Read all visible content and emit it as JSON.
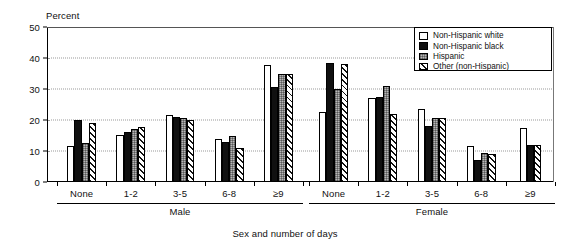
{
  "chart_data": {
    "type": "bar",
    "title": "",
    "xlabel": "Sex and number of days",
    "ylabel": "Percent",
    "ylim": [
      0,
      50
    ],
    "yticks": [
      0,
      10,
      20,
      30,
      40,
      50
    ],
    "grid": "horizontal dotted at 10, 20, 30, 40",
    "legend_position": "top-right inside plot",
    "panels": [
      "Male",
      "Female"
    ],
    "categories": [
      "None",
      "1-2",
      "3-5",
      "6-8",
      "≥9"
    ],
    "series": [
      {
        "name": "Non-Hispanic white",
        "pattern": "white",
        "male": [
          11.5,
          15.2,
          21.5,
          14.0,
          37.8
        ],
        "female": [
          22.5,
          27.0,
          23.5,
          11.5,
          17.5
        ]
      },
      {
        "name": "Non-Hispanic black",
        "pattern": "black",
        "male": [
          20.0,
          16.0,
          21.0,
          13.0,
          30.5
        ],
        "female": [
          38.5,
          27.5,
          18.0,
          7.0,
          12.0
        ]
      },
      {
        "name": "Hispanic",
        "pattern": "gray-stipple",
        "male": [
          12.5,
          17.0,
          20.5,
          15.0,
          35.0
        ],
        "female": [
          30.0,
          31.0,
          20.5,
          9.5,
          null
        ]
      },
      {
        "name": "Other (non-Hispanic)",
        "pattern": "diagonal-hatch",
        "male": [
          19.0,
          17.8,
          20.0,
          11.0,
          35.0
        ],
        "female": [
          38.0,
          22.0,
          20.5,
          9.0,
          12.0
        ]
      }
    ]
  },
  "axis": {
    "y_title": "Percent",
    "y_tick_labels": [
      "50",
      "40",
      "30",
      "20",
      "10",
      "0"
    ],
    "x_title": "Sex and number of days"
  },
  "legend": {
    "items": [
      {
        "label": "Non-Hispanic white"
      },
      {
        "label": "Non-Hispanic black"
      },
      {
        "label": "Hispanic"
      },
      {
        "label": "Other (non-Hispanic)"
      }
    ]
  },
  "panels": [
    {
      "name": "Male",
      "groups": [
        "None",
        "1-2",
        "3-5",
        "6-8",
        "≥9"
      ]
    },
    {
      "name": "Female",
      "groups": [
        "None",
        "1-2",
        "3-5",
        "6-8",
        "≥9"
      ]
    }
  ]
}
